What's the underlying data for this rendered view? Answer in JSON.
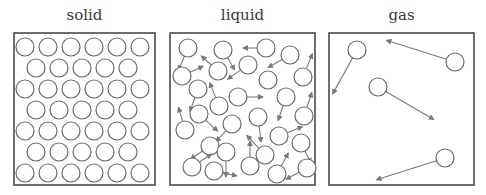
{
  "colors": {
    "stroke": "#6b6b6b",
    "box": "#4a4a4a",
    "arrow": "#7a7a7a",
    "background": "#ffffff"
  },
  "panels": [
    {
      "label": "solid",
      "box": {
        "x": 14,
        "y": 33,
        "w": 141,
        "h": 152
      },
      "circle_r": 9,
      "rows": [
        {
          "y": 47,
          "xs": [
            25,
            48,
            71,
            94,
            117,
            140
          ]
        },
        {
          "y": 68,
          "xs": [
            36,
            59,
            82,
            105,
            128
          ]
        },
        {
          "y": 89,
          "xs": [
            25,
            48,
            71,
            94,
            117,
            140
          ]
        },
        {
          "y": 110,
          "xs": [
            36,
            59,
            82,
            105,
            128
          ]
        },
        {
          "y": 131,
          "xs": [
            25,
            48,
            71,
            94,
            117,
            140
          ]
        },
        {
          "y": 152,
          "xs": [
            36,
            59,
            82,
            105,
            128
          ]
        },
        {
          "y": 173,
          "xs": [
            25,
            48,
            71,
            94,
            117,
            140
          ]
        }
      ]
    },
    {
      "label": "liquid",
      "box": {
        "x": 170,
        "y": 33,
        "w": 145,
        "h": 152
      },
      "circle_r": 9,
      "particles": [
        {
          "cx": 188,
          "cy": 48,
          "ax": -6,
          "ay": 14
        },
        {
          "cx": 223,
          "cy": 50,
          "ax": 7,
          "ay": 12
        },
        {
          "cx": 266,
          "cy": 48,
          "ax": -14,
          "ay": 0
        },
        {
          "cx": 290,
          "cy": 55,
          "ax": -14,
          "ay": 8
        },
        {
          "cx": 182,
          "cy": 76,
          "ax": 13,
          "ay": -6
        },
        {
          "cx": 218,
          "cy": 71,
          "ax": -10,
          "ay": -9
        },
        {
          "cx": 248,
          "cy": 65,
          "ax": -13,
          "ay": 9
        },
        {
          "cx": 303,
          "cy": 77,
          "ax": 6,
          "ay": -15
        },
        {
          "cx": 198,
          "cy": 89,
          "ax": -5,
          "ay": 14
        },
        {
          "cx": 268,
          "cy": 80,
          "ax": 0,
          "ay": 0
        },
        {
          "cx": 238,
          "cy": 97,
          "ax": 16,
          "ay": 0
        },
        {
          "cx": 286,
          "cy": 97,
          "ax": -5,
          "ay": 15
        },
        {
          "cx": 219,
          "cy": 106,
          "ax": -6,
          "ay": -15
        },
        {
          "cx": 199,
          "cy": 114,
          "ax": 12,
          "ay": 11
        },
        {
          "cx": 258,
          "cy": 117,
          "ax": 2,
          "ay": 16
        },
        {
          "cx": 304,
          "cy": 116,
          "ax": 5,
          "ay": -15
        },
        {
          "cx": 232,
          "cy": 124,
          "ax": -10,
          "ay": 11
        },
        {
          "cx": 185,
          "cy": 130,
          "ax": -4,
          "ay": -14
        },
        {
          "cx": 279,
          "cy": 136,
          "ax": 15,
          "ay": -6
        },
        {
          "cx": 301,
          "cy": 143,
          "ax": 6,
          "ay": 12
        },
        {
          "cx": 210,
          "cy": 146,
          "ax": -12,
          "ay": 8
        },
        {
          "cx": 226,
          "cy": 152,
          "ax": 0,
          "ay": 16
        },
        {
          "cx": 265,
          "cy": 155,
          "ax": -12,
          "ay": -13
        },
        {
          "cx": 250,
          "cy": 166,
          "ax": 0,
          "ay": -16
        },
        {
          "cx": 192,
          "cy": 167,
          "ax": 12,
          "ay": -8
        },
        {
          "cx": 214,
          "cy": 171,
          "ax": 14,
          "ay": 3
        },
        {
          "cx": 277,
          "cy": 174,
          "ax": 7,
          "ay": -13
        },
        {
          "cx": 307,
          "cy": 168,
          "ax": -13,
          "ay": 7
        }
      ]
    },
    {
      "label": "gas",
      "box": {
        "x": 329,
        "y": 33,
        "w": 145,
        "h": 152
      },
      "circle_r": 9,
      "particles": [
        {
          "cx": 357,
          "cy": 50,
          "ax": -20,
          "ay": 36
        },
        {
          "cx": 455,
          "cy": 62,
          "ax": -60,
          "ay": -19
        },
        {
          "cx": 378,
          "cy": 87,
          "ax": 48,
          "ay": 28
        },
        {
          "cx": 445,
          "cy": 158,
          "ax": -60,
          "ay": 19
        }
      ]
    }
  ]
}
